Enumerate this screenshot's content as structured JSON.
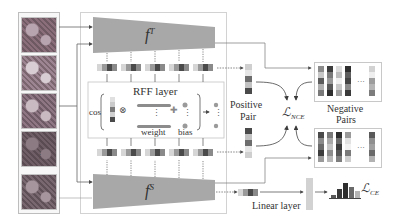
{
  "colors": {
    "network_fill": "#a8a8a8",
    "frame_stroke": "#c8c8c8",
    "arrow": "#555555",
    "dark": "#3a3a3a",
    "mid": "#7a7a7a",
    "light": "#c9c9c9",
    "pale": "#e2e2e2"
  },
  "input_images": {
    "tiles": [
      {
        "name": "histology-tile-1",
        "tone": [
          "#8a6f7a",
          "#b7a4ae",
          "#6e5963"
        ]
      },
      {
        "name": "histology-tile-2",
        "tone": [
          "#9d8591",
          "#d8cdd3",
          "#7b6670"
        ]
      },
      {
        "name": "histology-tile-3",
        "tone": [
          "#8e7682",
          "#c9b9c1",
          "#6d5a64"
        ]
      },
      {
        "name": "histology-tile-4",
        "tone": [
          "#6f5e66",
          "#8d7b84",
          "#5a4b53"
        ]
      },
      {
        "name": "histology-tile-5",
        "tone": [
          "#7a6870",
          "#a6959d",
          "#5f4f57"
        ]
      }
    ],
    "ellipsis": "⋮"
  },
  "teacher": {
    "label_base": "f",
    "label_sup": "T"
  },
  "student": {
    "label_base": "f",
    "label_sup": "S"
  },
  "rff_layer": {
    "title": "RFF layer",
    "cos_label": "cos",
    "weight_label": "weight",
    "bias_label": "bias",
    "multiply_symbol": "⊗",
    "plus_symbol": "✚",
    "vdots": "⋮"
  },
  "positive_pair": {
    "line1": "Positive",
    "line2": "Pair"
  },
  "negative_pairs": {
    "line1": "Negative",
    "line2": "Pairs",
    "ellipsis": "···"
  },
  "loss_nce": {
    "base": "ℒ",
    "sub": "NCE"
  },
  "loss_ce": {
    "base": "ℒ",
    "sub": "CE"
  },
  "linear_layer": {
    "label": "Linear layer"
  },
  "feature_vector_cells": [
    "#d6d6d6",
    "#9a9a9a",
    "#4a4a4a",
    "#8a8a8a"
  ],
  "positive_column_cells": [
    "#cfcfcf",
    "#e6e6e6",
    "#6d6d6d",
    "#c2c2c2",
    "#4a4a4a"
  ],
  "negative_columns_top": [
    [
      "#8c8c8c",
      "#c7c7c7",
      "#5c5c5c",
      "#b0b0b0",
      "#7a7a7a"
    ],
    [
      "#3e3e3e",
      "#7b7b7b",
      "#9a9a9a",
      "#5a5a5a",
      "#2e2e2e"
    ],
    [
      "#dcdcdc",
      "#bdbdbd",
      "#f0f0f0",
      "#c8c8c8",
      "#9e9e9e"
    ],
    [
      "#2f2f2f",
      "#5e5e5e",
      "#444444",
      "#8a8a8a",
      "#3a3a3a"
    ],
    [
      "#d2d2d2",
      "#eeeeee",
      "#9d9d9d",
      "#b5b5b5",
      "#7c7c7c"
    ]
  ],
  "negative_columns_bottom": [
    [
      "#4a4a4a",
      "#8a8a8a",
      "#6a6a6a",
      "#3c3c3c",
      "#9a9a9a"
    ],
    [
      "#7a7a7a",
      "#a9a9a9",
      "#c4c4c4",
      "#8d8d8d",
      "#b8b8b8"
    ],
    [
      "#2e2e2e",
      "#6b6b6b",
      "#3c3c3c",
      "#565656",
      "#7e7e7e"
    ],
    [
      "#9a9a9a",
      "#e2e2e2",
      "#f2f2f2",
      "#7a7a7a",
      "#cfcfcf"
    ],
    [
      "#5a5a5a",
      "#8f8f8f",
      "#a0a0a0",
      "#6a6a6a",
      "#b2b2b2"
    ]
  ],
  "ce_histogram": [
    0.2,
    0.55,
    0.95,
    0.7,
    0.45
  ]
}
